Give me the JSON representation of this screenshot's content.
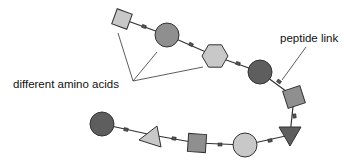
{
  "diagram": {
    "labels": {
      "amino_acids": "different amino acids",
      "peptide_link": "peptide link"
    },
    "colors": {
      "light": "#c8c8c8",
      "mid": "#8f8f8f",
      "dark": "#5e5e5e",
      "stroke": "#333333",
      "link": "#333333"
    },
    "residues": [
      {
        "shape": "square",
        "shade": "light",
        "cx": 122,
        "cy": 19,
        "size": 16,
        "rotate": 20
      },
      {
        "shape": "circle",
        "shade": "mid",
        "cx": 167,
        "cy": 35,
        "r": 12
      },
      {
        "shape": "hexagon",
        "shade": "light",
        "cx": 215,
        "cy": 56,
        "r": 13
      },
      {
        "shape": "circle",
        "shade": "dark",
        "cx": 260,
        "cy": 72,
        "r": 12
      },
      {
        "shape": "square",
        "shade": "mid",
        "cx": 294,
        "cy": 97,
        "size": 18,
        "rotate": -18
      },
      {
        "shape": "triangle-down",
        "shade": "dark",
        "cx": 290,
        "cy": 135
      },
      {
        "shape": "circle",
        "shade": "light",
        "cx": 245,
        "cy": 145,
        "r": 12
      },
      {
        "shape": "square",
        "shade": "mid",
        "cx": 197,
        "cy": 143,
        "size": 18,
        "rotate": 4
      },
      {
        "shape": "triangle",
        "shade": "light",
        "cx": 152,
        "cy": 135
      },
      {
        "shape": "circle",
        "shade": "dark",
        "cx": 102,
        "cy": 124,
        "r": 12
      }
    ]
  }
}
